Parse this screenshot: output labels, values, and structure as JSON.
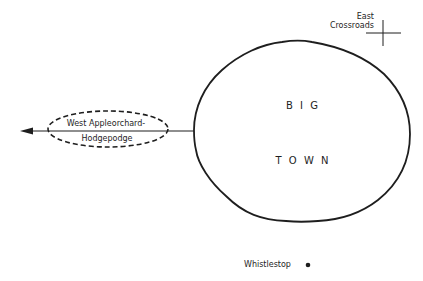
{
  "diagram": {
    "colors": {
      "stroke": "#1e1e1e",
      "background": "#ffffff",
      "text": "#1e1e1e"
    },
    "big_town": {
      "line1": "B I G",
      "line2": "T O W N"
    },
    "west_appleorchard": {
      "line1": "West Appleorchard-",
      "line2": "Hodgepodge"
    },
    "east_crossroads": {
      "line1": "East",
      "line2": "Crossroads"
    },
    "whistlestop": {
      "label": "Whistlestop"
    }
  }
}
